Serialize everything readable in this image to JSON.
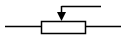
{
  "diagram": {
    "type": "circuit-symbol",
    "symbol": "potentiometer",
    "colors": {
      "stroke": "#000000",
      "fill": "#ffffff",
      "background": "#ffffff"
    },
    "components": [
      {
        "name": "left-lead",
        "kind": "wire"
      },
      {
        "name": "resistor-body",
        "kind": "rectangle"
      },
      {
        "name": "right-lead",
        "kind": "wire"
      },
      {
        "name": "wiper",
        "kind": "arrow"
      }
    ]
  }
}
